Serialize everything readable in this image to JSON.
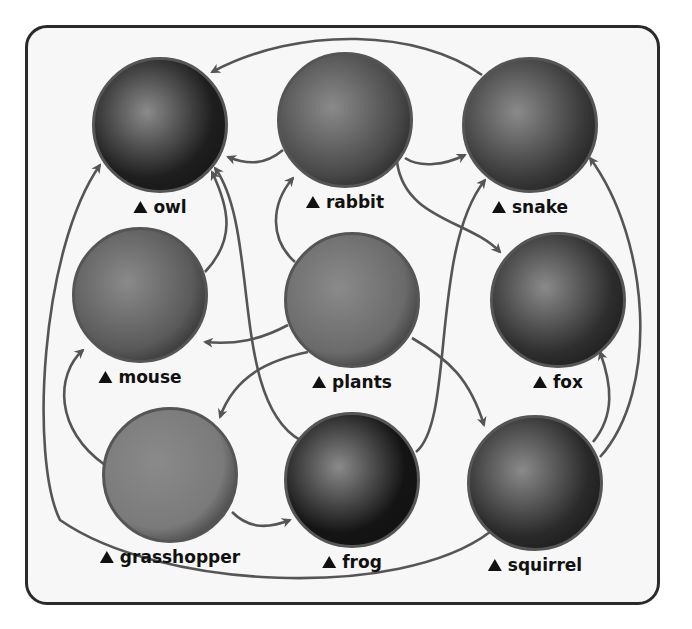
{
  "diagram": {
    "type": "food-web",
    "arrow_color": "#555555",
    "nodes": [
      {
        "id": "owl",
        "label": "owl",
        "cx": 160,
        "cy": 125,
        "r": 68,
        "photo_tone": "#1e1e1e"
      },
      {
        "id": "rabbit",
        "label": "rabbit",
        "cx": 345,
        "cy": 120,
        "r": 68,
        "photo_tone": "#4a4a4a"
      },
      {
        "id": "snake",
        "label": "snake",
        "cx": 530,
        "cy": 125,
        "r": 68,
        "photo_tone": "#3a3a3a"
      },
      {
        "id": "mouse",
        "label": "mouse",
        "cx": 140,
        "cy": 295,
        "r": 68,
        "photo_tone": "#5a5a5a"
      },
      {
        "id": "plants",
        "label": "plants",
        "cx": 352,
        "cy": 300,
        "r": 68,
        "photo_tone": "#6a6a6a"
      },
      {
        "id": "fox",
        "label": "fox",
        "cx": 558,
        "cy": 300,
        "r": 68,
        "photo_tone": "#2e2e2e"
      },
      {
        "id": "grasshopper",
        "label": "grasshopper",
        "cx": 170,
        "cy": 475,
        "r": 68,
        "photo_tone": "#7a7a7a"
      },
      {
        "id": "frog",
        "label": "frog",
        "cx": 352,
        "cy": 480,
        "r": 68,
        "photo_tone": "#141414"
      },
      {
        "id": "squirrel",
        "label": "squirrel",
        "cx": 535,
        "cy": 483,
        "r": 68,
        "photo_tone": "#2a2a2a"
      }
    ],
    "edges": [
      {
        "from": "plants",
        "to": "rabbit"
      },
      {
        "from": "plants",
        "to": "mouse"
      },
      {
        "from": "plants",
        "to": "grasshopper"
      },
      {
        "from": "plants",
        "to": "squirrel"
      },
      {
        "from": "rabbit",
        "to": "owl"
      },
      {
        "from": "rabbit",
        "to": "snake"
      },
      {
        "from": "rabbit",
        "to": "fox"
      },
      {
        "from": "snake",
        "to": "owl"
      },
      {
        "from": "mouse",
        "to": "owl"
      },
      {
        "from": "mouse",
        "to": "snake"
      },
      {
        "from": "grasshopper",
        "to": "mouse"
      },
      {
        "from": "grasshopper",
        "to": "frog"
      },
      {
        "from": "frog",
        "to": "owl"
      },
      {
        "from": "frog",
        "to": "snake"
      },
      {
        "from": "squirrel",
        "to": "fox"
      },
      {
        "from": "squirrel",
        "to": "snake"
      },
      {
        "from": "squirrel",
        "to": "owl"
      }
    ]
  }
}
